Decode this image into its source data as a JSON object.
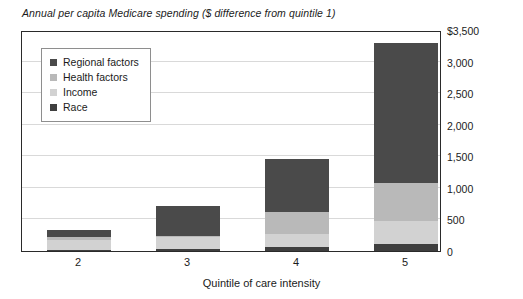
{
  "chart_data": {
    "type": "bar",
    "subtype": "stacked-bar",
    "title": "Annual per capita Medicare spending ($ difference from quintile 1)",
    "xlabel": "Quintile of care intensity",
    "ylabel": "",
    "categories": [
      "2",
      "3",
      "4",
      "5"
    ],
    "series": [
      {
        "name": "Race",
        "color": "#3f3f3f",
        "values": [
          20,
          25,
          65,
          110
        ]
      },
      {
        "name": "Income",
        "color": "#d2d2d2",
        "values": [
          150,
          195,
          205,
          365
        ]
      },
      {
        "name": "Health factors",
        "color": "#b9b9b9",
        "values": [
          55,
          25,
          350,
          600
        ]
      },
      {
        "name": "Regional factors",
        "color": "#4a4a4a",
        "values": [
          105,
          465,
          830,
          2225
        ]
      }
    ],
    "totals": [
      330,
      710,
      1450,
      3300
    ],
    "ylim": [
      0,
      3500
    ],
    "yticks": [
      0,
      500,
      1000,
      1500,
      2000,
      2500,
      3000,
      3500
    ],
    "ytick_labels": [
      "0",
      "500",
      "1,000",
      "1,500",
      "2,000",
      "2,500",
      "3,000",
      "$3,500"
    ],
    "grid": true,
    "legend_position": "top-left",
    "legend_order": [
      "Regional factors",
      "Health factors",
      "Income",
      "Race"
    ]
  }
}
